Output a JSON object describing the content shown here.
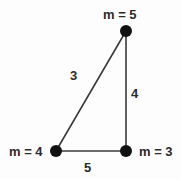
{
  "figure": {
    "type": "triangle-diagram",
    "background_color": "#fdfdfd",
    "stroke_color": "#3a3a3a",
    "vertex_color": "#111111",
    "text_color": "#2b2b2b",
    "canvas": {
      "width": 181,
      "height": 179
    },
    "vertices": [
      {
        "id": "top",
        "label": "m = 5",
        "x": 126,
        "y": 31,
        "label_position": "above"
      },
      {
        "id": "bottom_left",
        "label": "m = 4",
        "x": 56,
        "y": 151,
        "label_position": "left"
      },
      {
        "id": "bottom_right",
        "label": "m = 3",
        "x": 126,
        "y": 151,
        "label_position": "right"
      }
    ],
    "edges": [
      {
        "id": "hypotenuse",
        "label": "3",
        "from": "bottom_left",
        "to": "top",
        "label_position": "left-of-midpoint"
      },
      {
        "id": "vertical",
        "label": "4",
        "from": "top",
        "to": "bottom_right",
        "label_position": "right-of-midpoint"
      },
      {
        "id": "base",
        "label": "5",
        "from": "bottom_left",
        "to": "bottom_right",
        "label_position": "below-midpoint"
      }
    ]
  }
}
